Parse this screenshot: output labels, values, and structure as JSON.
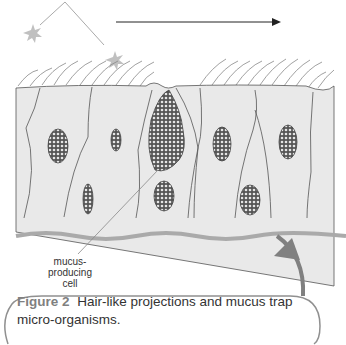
{
  "diagram": {
    "labels": {
      "mucus_cell": [
        "mucus-",
        "producing",
        "cell"
      ]
    },
    "caption": {
      "figure_number": "Figure 2",
      "text": "Hair-like projections and mucus trap micro-organisms."
    },
    "colors": {
      "tissue": "#e9e9e9",
      "outline": "#555555",
      "particle": "#c0c0c0",
      "arrow": "#808080",
      "caption_box": "#909090"
    }
  }
}
